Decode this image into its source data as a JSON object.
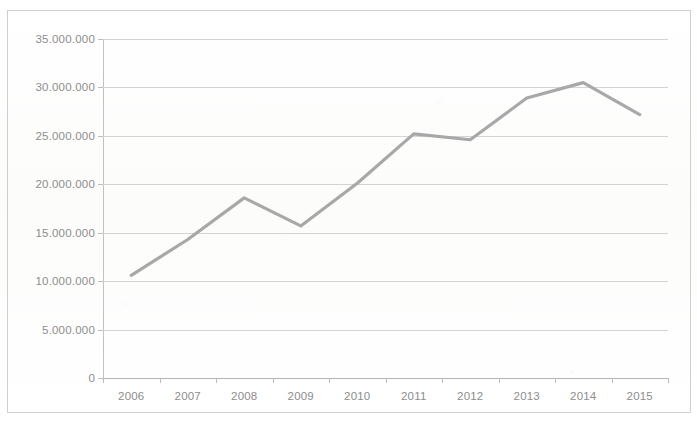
{
  "chart_data": {
    "type": "line",
    "title": "",
    "subtitle": "",
    "xlabel": "",
    "ylabel": "",
    "categories": [
      "2006",
      "2007",
      "2008",
      "2009",
      "2010",
      "2011",
      "2012",
      "2013",
      "2014",
      "2015"
    ],
    "x": [
      2006,
      2007,
      2008,
      2009,
      2010,
      2011,
      2012,
      2013,
      2014,
      2015
    ],
    "series": [
      {
        "name": "",
        "color": "#a8a8a8",
        "values": [
          10600000,
          14300000,
          18600000,
          15700000,
          20100000,
          25200000,
          24600000,
          28900000,
          30500000,
          27200000
        ]
      }
    ],
    "values": [
      10600000,
      14300000,
      18600000,
      15700000,
      20100000,
      25200000,
      24600000,
      28900000,
      30500000,
      27200000
    ],
    "ylim": [
      0,
      35000000
    ],
    "ytick_values": [
      0,
      5000000,
      10000000,
      15000000,
      20000000,
      25000000,
      30000000,
      35000000
    ],
    "ytick_labels": [
      "0",
      "5.000.000",
      "10.000.000",
      "15.000.000",
      "20.000.000",
      "25.000.000",
      "30.000.000",
      "35.000.000"
    ],
    "xtick_labels": [
      "2006",
      "2007",
      "2008",
      "2009",
      "2010",
      "2011",
      "2012",
      "2013",
      "2014",
      "2015"
    ],
    "grid": true,
    "grid_axis": "y",
    "legend": false,
    "legend_position": "none",
    "annotations": []
  },
  "colors": {
    "line": "#a8a8a8",
    "gridline": "#d4d4d4",
    "axis": "#bdbdbd",
    "tick_text": "#8d8d8d",
    "frame": "#cfcfcf",
    "background": "#fdfdfd"
  }
}
